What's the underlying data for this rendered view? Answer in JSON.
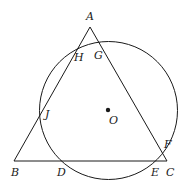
{
  "diagram": {
    "type": "geometry",
    "stroke_color": "#1a1a1a",
    "triangle": {
      "vertices": {
        "A": {
          "label": "A",
          "x": 90,
          "y": 27
        },
        "B": {
          "label": "B",
          "x": 14,
          "y": 161
        },
        "C": {
          "label": "C",
          "x": 167,
          "y": 161
        }
      }
    },
    "circle": {
      "center": {
        "label": "O",
        "x": 108,
        "y": 110
      },
      "radius": 69
    },
    "intersection_points": {
      "G": {
        "label": "G",
        "on": "AC"
      },
      "H": {
        "label": "H",
        "on": "AB"
      },
      "J": {
        "label": "J",
        "on": "AB"
      },
      "D": {
        "label": "D",
        "on": "BC"
      },
      "E": {
        "label": "E",
        "on": "BC"
      },
      "F": {
        "label": "F",
        "on": "AC"
      }
    }
  }
}
